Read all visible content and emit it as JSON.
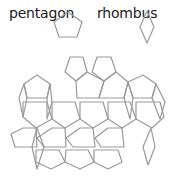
{
  "legend": {
    "pentagon_label": "pentagon",
    "rhombus_label": "rhombus"
  },
  "colors": {
    "stroke": "#9a9a9a",
    "text": "#1a1a1a",
    "background": "#ffffff"
  },
  "icons": {
    "pentagon": "pentagon-icon",
    "rhombus": "rhombus-icon"
  },
  "legend_shapes": {
    "pentagon_points": "68,12 82,22 77,37 59,37 54,22",
    "rhombus_points": "147,11 154,27 147,43 140,27"
  },
  "tiling": {
    "description": "Tiling of regular pentagons and thin rhombi",
    "pentagons": [
      "70,57 83,57 87,72 76,81 65,72",
      "97,57 111,57 116,72 104,81 92,72",
      "37,75 50,84 47,98 27,98 24,84",
      "76,81 87,72 104,81 99,98 77,98",
      "104,81 116,72 128,82 124,98 99,98",
      "143,75 156,84 152,98 133,98 128,82",
      "23,102 47,102 52,119 36,128 23,117",
      "52,102 75,102 80,119 65,128 52,119",
      "80,102 103,102 108,119 93,128 80,119",
      "108,102 130,102 136,119 122,128 108,119",
      "136,102 160,102 164,117 152,128 136,119",
      "23,128 36,128 37,147 15,147 11,134",
      "52,128 65,128 66,147 44,147 37,138",
      "80,128 93,128 95,147 73,147 66,138",
      "108,128 122,128 124,147 101,147 95,138",
      "36,150 59,150 65,162 51,169 36,162",
      "66,150 88,150 94,162 80,169 65,162",
      "94,150 118,150 122,162 108,169 94,162"
    ],
    "rhombi": [
      "24,84 27,98 23,117 19,98",
      "50,84 52,102 47,119 47,98",
      "128,82 133,98 130,119 124,98",
      "156,84 165,102 160,119 152,98",
      "37,128 44,147 37,169 32,147",
      "151,128 155,147 148,165 143,147"
    ]
  }
}
